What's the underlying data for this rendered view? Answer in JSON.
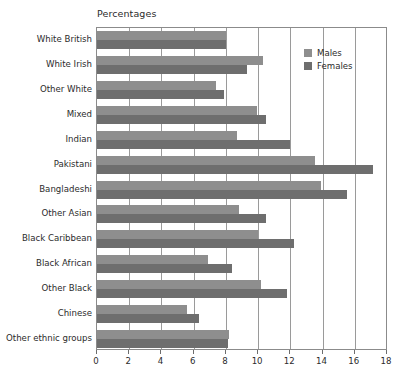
{
  "chart_data": {
    "type": "bar",
    "orientation": "horizontal",
    "title": "Percentages",
    "xlabel": "",
    "ylabel": "",
    "xlim": [
      0,
      18
    ],
    "xticks": [
      0,
      2,
      4,
      6,
      8,
      10,
      12,
      14,
      16,
      18
    ],
    "xtick_labels": [
      "0",
      "2",
      "4",
      "6",
      "8",
      "10",
      "12",
      "14",
      "16",
      "18"
    ],
    "grid": true,
    "grid_axis": "x",
    "legend_position": "top-right",
    "categories": [
      "White British",
      "White Irish",
      "Other White",
      "Mixed",
      "Indian",
      "Pakistani",
      "Bangladeshi",
      "Other Asian",
      "Black Caribbean",
      "Black African",
      "Other Black",
      "Chinese",
      "Other ethnic groups"
    ],
    "series": [
      {
        "name": "Males",
        "color": "#8e8e8e",
        "values": [
          8.0,
          10.3,
          7.4,
          9.9,
          8.7,
          13.5,
          13.9,
          8.8,
          10.0,
          6.9,
          10.2,
          5.6,
          8.2
        ]
      },
      {
        "name": "Females",
        "color": "#6e6e6e",
        "values": [
          8.0,
          9.3,
          7.9,
          10.5,
          12.0,
          17.1,
          15.5,
          10.5,
          12.2,
          8.4,
          11.8,
          6.3,
          8.1
        ]
      }
    ]
  }
}
